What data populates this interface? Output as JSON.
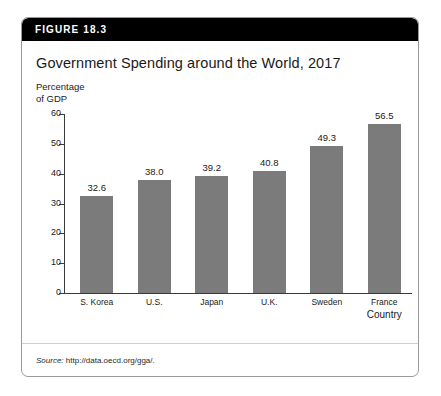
{
  "figure": {
    "header_label": "FIGURE 18.3",
    "title": "Government Spending around the World, 2017",
    "source_label": "Source:",
    "source_url": "http://data.oecd.org/gga/."
  },
  "chart_data": {
    "type": "bar",
    "title": "Government Spending around the World, 2017",
    "xlabel": "Country",
    "ylabel": "Percentage\nof GDP",
    "categories": [
      "S. Korea",
      "U.S.",
      "Japan",
      "U.K.",
      "Sweden",
      "France"
    ],
    "values": [
      32.6,
      38.0,
      39.2,
      40.8,
      49.3,
      56.5
    ],
    "value_labels": [
      "32.6",
      "38.0",
      "39.2",
      "40.8",
      "49.3",
      "56.5"
    ],
    "ylim": [
      0,
      60
    ],
    "yticks": [
      0,
      10,
      20,
      30,
      40,
      50,
      60
    ],
    "ytick_labels": [
      "0",
      "10",
      "20",
      "30",
      "40",
      "50",
      "60"
    ],
    "grid": false,
    "legend": false,
    "bar_color": "#7b7b7b",
    "axis_color": "#3a3a3a"
  }
}
